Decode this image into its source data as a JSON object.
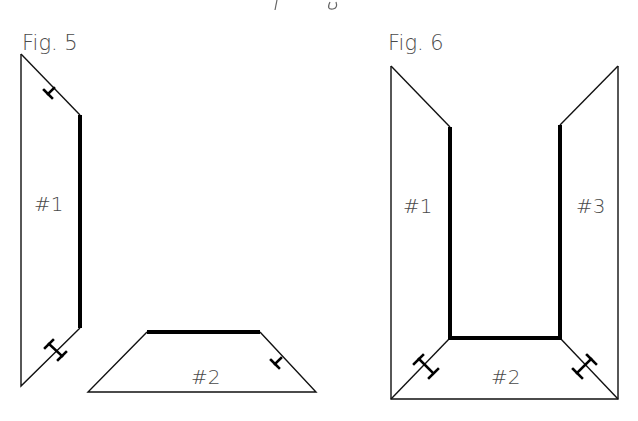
{
  "header": {
    "cropped_text": "p g"
  },
  "figures": [
    {
      "id": "fig5",
      "title": "Fig. 5",
      "panels": [
        {
          "label": "#1"
        },
        {
          "label": "#2"
        }
      ]
    },
    {
      "id": "fig6",
      "title": "Fig. 6",
      "panels": [
        {
          "label": "#1"
        },
        {
          "label": "#2"
        },
        {
          "label": "#3"
        }
      ]
    }
  ],
  "colors": {
    "line": "#000000",
    "text": "#4a4a4a",
    "background": "#ffffff"
  }
}
